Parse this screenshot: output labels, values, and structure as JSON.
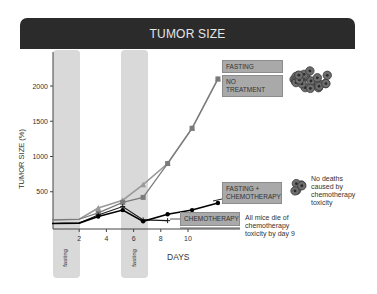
{
  "header": {
    "title": "TUMOR SIZE"
  },
  "axes": {
    "ylabel": "TUMOR SIZE (%)",
    "xlabel": "DAYS",
    "yticks": [
      "500",
      "1000",
      "1500",
      "2000"
    ],
    "xticks": [
      "2",
      "4",
      "6",
      "8",
      "10"
    ]
  },
  "fasting_bands": [
    {
      "label": "fasting",
      "start_day": 0,
      "end_day": 2
    },
    {
      "label": "fasting",
      "start_day": 5,
      "end_day": 7
    }
  ],
  "labels": {
    "fasting": "FASTING",
    "no_treatment_line1": "NO",
    "no_treatment_line2": "TREATMENT",
    "fasting_chemo_line1": "FASTING +",
    "fasting_chemo_line2": "CHEMOTHERAPY",
    "chemotherapy": "CHEMOTHERAPY"
  },
  "notes": {
    "no_deaths": [
      "No deaths",
      "caused by",
      "chemotherapy",
      "toxicity"
    ],
    "all_die": [
      "All mice die of",
      "chemotherapy",
      "toxicity by day 9"
    ]
  },
  "colors": {
    "header_bg": "#2b2b2b",
    "band": "#d9d9d9",
    "fasting_line": "#9a9a9a",
    "no_treatment_line": "#7a7a7a",
    "chemo_line": "#1a1a1a",
    "fasting_chemo_line": "#000000",
    "label_box": "#a9a9a9"
  },
  "chart_data": {
    "type": "line",
    "title": "TUMOR SIZE",
    "xlabel": "DAYS",
    "ylabel": "TUMOR SIZE (%)",
    "xlim": [
      0,
      12.5
    ],
    "ylim": [
      0,
      2400
    ],
    "grid": false,
    "annotations": [
      "fasting (days 0-2)",
      "fasting (days 5-7)",
      "No deaths caused by chemotherapy toxicity",
      "All mice die of chemotherapy toxicity by day 9"
    ],
    "series": [
      {
        "name": "FASTING",
        "x": [
          0,
          2,
          3.4,
          5.2,
          6.7,
          8.5,
          10.3,
          12.2
        ],
        "y": [
          100,
          110,
          270,
          380,
          600,
          900,
          1400,
          2100
        ]
      },
      {
        "name": "NO TREATMENT",
        "x": [
          0,
          2,
          3.4,
          5.2,
          6.7,
          8.5,
          10.3,
          12.2
        ],
        "y": [
          100,
          110,
          200,
          350,
          420,
          900,
          1400,
          2100
        ]
      },
      {
        "name": "CHEMOTHERAPY",
        "x": [
          0,
          2,
          3.4,
          5.2,
          6.7,
          8.5
        ],
        "y": [
          50,
          55,
          170,
          290,
          100,
          90
        ]
      },
      {
        "name": "FASTING + CHEMOTHERAPY",
        "x": [
          0,
          2,
          3.4,
          5.2,
          6.7,
          8.5,
          10.3,
          12.2
        ],
        "y": [
          50,
          55,
          150,
          240,
          80,
          180,
          240,
          340
        ]
      }
    ]
  }
}
